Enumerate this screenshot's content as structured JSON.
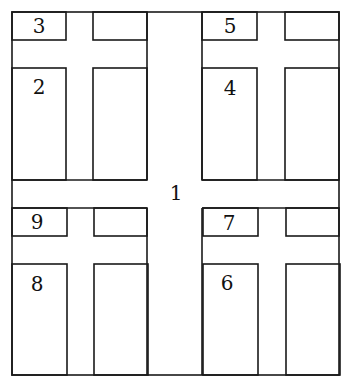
{
  "diagram": {
    "type": "floor-plan-grid",
    "colors": {
      "line": "#1a1a1a",
      "background": "#ffffff",
      "text": "#111111"
    },
    "outer": {
      "x": 12,
      "y": 12,
      "w": 327,
      "h": 363
    },
    "center_label": {
      "text": "1",
      "x": 176,
      "y": 200
    },
    "quadrants": [
      {
        "name": "top-left",
        "x": 12,
        "y": 12,
        "small_label": "3",
        "large_label": "2"
      },
      {
        "name": "top-right",
        "x": 202,
        "y": 12,
        "small_label": "5",
        "large_label": "4"
      },
      {
        "name": "bottom-left",
        "x": 12,
        "y": 208,
        "small_label": "9",
        "large_label": "8"
      },
      {
        "name": "bottom-right",
        "x": 202,
        "y": 208,
        "small_label": "7",
        "large_label": "6"
      }
    ],
    "labels": {
      "r1": "1",
      "r2": "2",
      "r3": "3",
      "r4": "4",
      "r5": "5",
      "r6": "6",
      "r7": "7",
      "r8": "8",
      "r9": "9"
    }
  }
}
